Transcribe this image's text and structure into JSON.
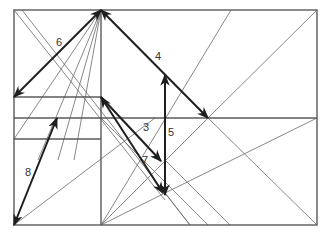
{
  "diagram": {
    "title": "",
    "colors": {
      "frame": "#5a5a5a",
      "thin": "#6a6a6a",
      "arrow": "#1e1e1e",
      "label": "#333333"
    },
    "frame": {
      "x1": 14,
      "y1": 10,
      "x2": 317,
      "y2": 225
    },
    "frame_lines": [
      {
        "id": "vertical-divider",
        "x1": 101,
        "y1": 10,
        "x2": 101,
        "y2": 225
      },
      {
        "id": "horizontal-mid",
        "x1": 14,
        "y1": 118,
        "x2": 317,
        "y2": 118
      },
      {
        "id": "horizontal-upper-left",
        "x1": 14,
        "y1": 97,
        "x2": 101,
        "y2": 97
      },
      {
        "id": "horizontal-lower-left",
        "x1": 14,
        "y1": 139,
        "x2": 101,
        "y2": 139
      }
    ],
    "thin_lines": [
      {
        "id": "diag-topleft-1",
        "x1": 14,
        "y1": 10,
        "x2": 165,
        "y2": 200
      },
      {
        "id": "diag-topleft-2",
        "x1": 22,
        "y1": 10,
        "x2": 190,
        "y2": 225
      },
      {
        "id": "apex-fan-1",
        "x1": 101,
        "y1": 10,
        "x2": 14,
        "y2": 139
      },
      {
        "id": "apex-fan-2",
        "x1": 101,
        "y1": 10,
        "x2": 38,
        "y2": 160
      },
      {
        "id": "apex-fan-3",
        "x1": 101,
        "y1": 10,
        "x2": 58,
        "y2": 160
      },
      {
        "id": "apex-fan-4",
        "x1": 101,
        "y1": 10,
        "x2": 74,
        "y2": 160
      },
      {
        "id": "diag-up-1",
        "x1": 101,
        "y1": 225,
        "x2": 231,
        "y2": 10
      },
      {
        "id": "diag-up-2",
        "x1": 14,
        "y1": 225,
        "x2": 155,
        "y2": 118
      },
      {
        "id": "diag-up-3",
        "x1": 208,
        "y1": 118,
        "x2": 317,
        "y2": 10
      },
      {
        "id": "diag-up-4",
        "x1": 101,
        "y1": 118,
        "x2": 208,
        "y2": 225
      },
      {
        "id": "diag-long-right",
        "x1": 165,
        "y1": 193,
        "x2": 317,
        "y2": 118
      },
      {
        "id": "diag-down-right",
        "x1": 208,
        "y1": 118,
        "x2": 317,
        "y2": 225
      },
      {
        "id": "diag-down-mid",
        "x1": 165,
        "y1": 160,
        "x2": 230,
        "y2": 225
      },
      {
        "id": "diag-down-low",
        "x1": 165,
        "y1": 193,
        "x2": 190,
        "y2": 225
      },
      {
        "id": "diag-fan-bottom",
        "x1": 101,
        "y1": 225,
        "x2": 165,
        "y2": 193
      },
      {
        "id": "diag-fan-bottom-2",
        "x1": 101,
        "y1": 225,
        "x2": 208,
        "y2": 118
      }
    ],
    "arrows": [
      {
        "id": "arrow-3",
        "label": "3",
        "x1": 101,
        "y1": 97,
        "x2": 161,
        "y2": 161,
        "heads": "end",
        "label_x": 143,
        "label_y": 131
      },
      {
        "id": "arrow-4",
        "label": "4",
        "x1": 101,
        "y1": 10,
        "x2": 208,
        "y2": 118,
        "heads": "both",
        "label_x": 155,
        "label_y": 60
      },
      {
        "id": "arrow-5",
        "label": "5",
        "x1": 165,
        "y1": 160,
        "x2": 165,
        "y2": 75,
        "heads": "end",
        "label_x": 168,
        "label_y": 136
      },
      {
        "id": "arrow-5b",
        "label": "",
        "x1": 165,
        "y1": 118,
        "x2": 165,
        "y2": 195,
        "heads": "end",
        "label_x": 0,
        "label_y": 0
      },
      {
        "id": "arrow-6",
        "label": "6",
        "x1": 101,
        "y1": 10,
        "x2": 14,
        "y2": 97,
        "heads": "both",
        "label_x": 56,
        "label_y": 46
      },
      {
        "id": "arrow-7",
        "label": "7",
        "x1": 101,
        "y1": 97,
        "x2": 163,
        "y2": 193,
        "heads": "both",
        "label_x": 142,
        "label_y": 164
      },
      {
        "id": "arrow-8",
        "label": "8",
        "x1": 14,
        "y1": 225,
        "x2": 57,
        "y2": 118,
        "heads": "both",
        "label_x": 25,
        "label_y": 176
      }
    ]
  }
}
